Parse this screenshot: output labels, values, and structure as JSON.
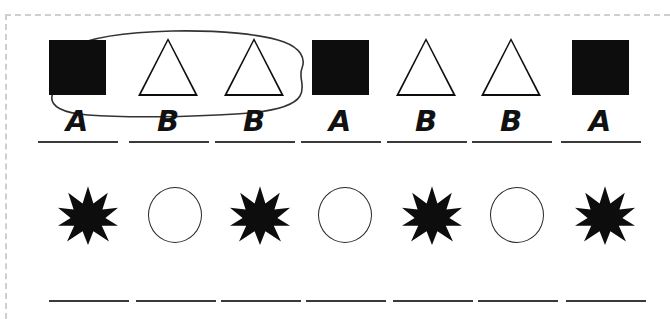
{
  "worksheet": {
    "title": "Pattern worksheet",
    "border": {
      "style": "dashed",
      "color": "#cfcfcf"
    },
    "ink_color": "#0d0d0d",
    "line_color": "#3a3a3a"
  },
  "rows": [
    {
      "name": "shape-pattern-row",
      "shapes": [
        {
          "icon": "filled-square-icon",
          "label": "A",
          "circled": true
        },
        {
          "icon": "outline-triangle-icon",
          "label": "B",
          "circled": true
        },
        {
          "icon": "outline-triangle-icon",
          "label": "B",
          "circled": true
        },
        {
          "icon": "filled-square-icon",
          "label": "A",
          "circled": false
        },
        {
          "icon": "outline-triangle-icon",
          "label": "B",
          "circled": false
        },
        {
          "icon": "outline-triangle-icon",
          "label": "B",
          "circled": false
        },
        {
          "icon": "filled-square-icon",
          "label": "A",
          "circled": false
        }
      ],
      "annotation": "hand-drawn-loop-around-first-three"
    },
    {
      "name": "object-pattern-row",
      "shapes": [
        {
          "icon": "filled-star-icon",
          "label": "",
          "circled": false
        },
        {
          "icon": "outline-circle-icon",
          "label": "",
          "circled": false
        },
        {
          "icon": "filled-star-icon",
          "label": "",
          "circled": false
        },
        {
          "icon": "outline-circle-icon",
          "label": "",
          "circled": false
        },
        {
          "icon": "filled-star-icon",
          "label": "",
          "circled": false
        },
        {
          "icon": "outline-circle-icon",
          "label": "",
          "circled": false
        },
        {
          "icon": "filled-star-icon",
          "label": "",
          "circled": false
        }
      ],
      "annotation": ""
    }
  ]
}
